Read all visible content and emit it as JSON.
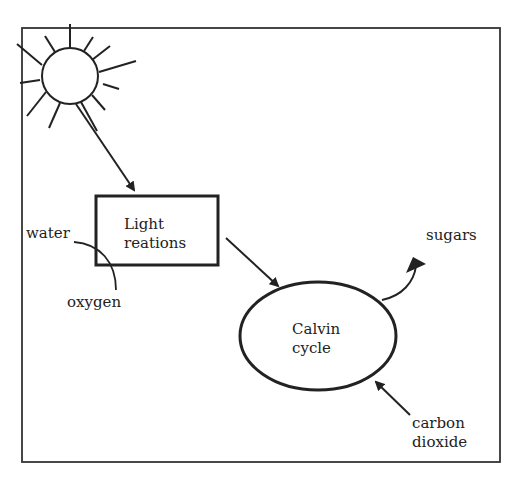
{
  "diagram": {
    "nodes": {
      "light_reactions": {
        "line1": "Light",
        "line2": "reations"
      },
      "calvin_cycle": {
        "line1": "Calvin",
        "line2": "cycle"
      }
    },
    "labels": {
      "water": "water",
      "oxygen": "oxygen",
      "sugars": "sugars",
      "carbon_line1": "carbon",
      "carbon_line2": "dioxide"
    },
    "icons": {
      "sun": "sun-icon"
    },
    "edges": [
      {
        "from": "sun",
        "to": "light_reactions"
      },
      {
        "from": "water",
        "to": "light_reactions",
        "out": "oxygen"
      },
      {
        "from": "light_reactions",
        "to": "calvin_cycle"
      },
      {
        "from": "calvin_cycle",
        "to": "sugars"
      },
      {
        "from": "carbon dioxide",
        "to": "calvin_cycle"
      }
    ],
    "colors": {
      "stroke": "#222222",
      "background": "#ffffff"
    }
  }
}
